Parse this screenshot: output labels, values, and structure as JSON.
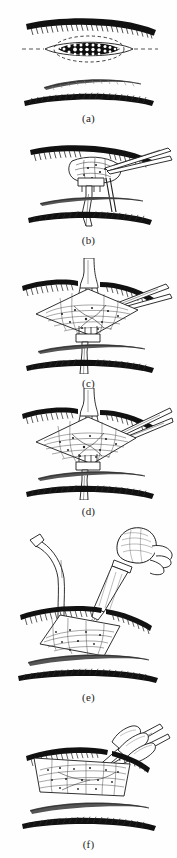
{
  "figure": {
    "domain_note": "surgical technique line illustration, six sequential panels",
    "background_color": "#fefefe",
    "ink_color": "#111111",
    "panels": [
      {
        "id": "a",
        "caption": "(a)",
        "title": "Contaminated wound with devitalized tissue",
        "elements": [
          "upper skin edge with hatched shading",
          "dark stippled necrotic lesion at center",
          "dashed elliptical excision outline around lesion",
          "middle fascia band",
          "lower tissue layer with hatched shading"
        ]
      },
      {
        "id": "b",
        "caption": "(b)",
        "title": "Elevation of the wound edge with forceps and retractor",
        "elements": [
          "upper skin edge",
          "tissue flap lifted at center",
          "two-pronged rake retractor below flap",
          "forceps entering from upper right",
          "middle fascia band",
          "lower tissue layer"
        ]
      },
      {
        "id": "c",
        "caption": "(c)",
        "title": "Wound spread open with two rake retractors",
        "elements": [
          "upper skin edge",
          "upper rake retractor pulling superiorly",
          "diamond-shaped opened wound bed with hatching",
          "lower rake retractor pulling inferiorly",
          "forceps from upper right",
          "middle fascia band",
          "lower tissue layer"
        ]
      },
      {
        "id": "d",
        "caption": "(d)",
        "title": "Sharp debridement of devitalized tissue with scissors",
        "elements": [
          "upper skin edge",
          "upper rake retractor",
          "opened wound bed",
          "scissors entering from upper right",
          "lower rake retractor with long handle",
          "middle fascia band",
          "lower tissue layer"
        ]
      },
      {
        "id": "e",
        "caption": "(e)",
        "title": "Copious irrigation of the wound with bulb syringe",
        "elements": [
          "suction cannula curving from the left",
          "bulb syringe held in gloved hand from upper right",
          "irrigation stream into wound bed",
          "upper skin edge",
          "open wound bed with hatching",
          "middle fascia band",
          "lower tissue layer"
        ]
      },
      {
        "id": "f",
        "caption": "(f)",
        "title": "Inspection of the clean wound bed with forceps",
        "elements": [
          "upper skin edge",
          "wide open wound bed with granulation hatching",
          "forceps with gloved fingers from upper right",
          "middle fascia band",
          "lower tissue layer"
        ]
      }
    ]
  }
}
